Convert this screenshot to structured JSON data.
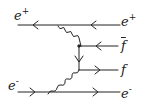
{
  "diagram": {
    "stroke_color": "#222222",
    "background": "#ffffff",
    "particles": {
      "e_plus_in": {
        "symbol": "e",
        "charge": "+"
      },
      "e_plus_out": {
        "symbol": "e",
        "charge": "+"
      },
      "fbar_out": {
        "symbol": "f"
      },
      "f_out": {
        "symbol": "f"
      },
      "e_minus_in": {
        "symbol": "e",
        "charge": "-"
      },
      "e_minus_out": {
        "symbol": "e",
        "charge": "-"
      }
    },
    "lines": [
      {
        "id": "positron-line",
        "type": "fermion",
        "from": [
          18,
          25
        ],
        "to": [
          120,
          25
        ],
        "arrow": "left"
      },
      {
        "id": "photon-upper",
        "type": "photon",
        "from": [
          58,
          25
        ],
        "to": [
          79,
          46
        ]
      },
      {
        "id": "internal-fermion",
        "type": "fermion",
        "from": [
          79,
          46
        ],
        "to": [
          79,
          70
        ],
        "arrow": "down"
      },
      {
        "id": "fbar-line",
        "type": "fermion",
        "from": [
          79,
          46
        ],
        "to": [
          118,
          46
        ],
        "arrow": "left"
      },
      {
        "id": "f-line",
        "type": "fermion",
        "from": [
          79,
          70
        ],
        "to": [
          118,
          70
        ],
        "arrow": "right"
      },
      {
        "id": "photon-lower",
        "type": "photon",
        "from": [
          79,
          70
        ],
        "to": [
          52,
          92
        ]
      },
      {
        "id": "electron-line",
        "type": "fermion",
        "from": [
          18,
          92
        ],
        "to": [
          120,
          92
        ],
        "arrow": "right"
      }
    ]
  }
}
